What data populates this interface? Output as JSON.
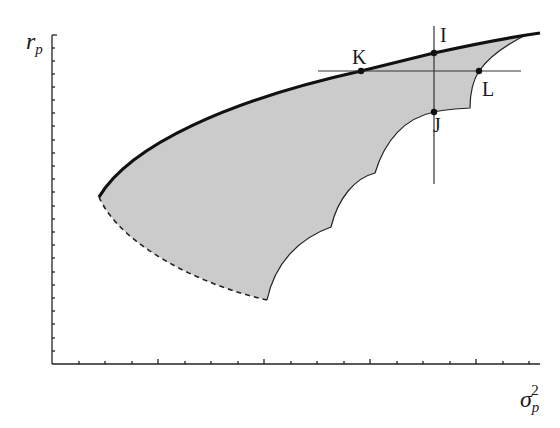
{
  "figure": {
    "type": "portfolio-feasible-region-diagram",
    "y_axis": {
      "label": "r",
      "label_sub": "p"
    },
    "x_axis": {
      "label": "σ",
      "label_sub": "p",
      "label_sup": "2"
    },
    "points": [
      {
        "id": "I",
        "label": "I"
      },
      {
        "id": "J",
        "label": "J"
      },
      {
        "id": "K",
        "label": "K"
      },
      {
        "id": "L",
        "label": "L"
      }
    ],
    "colors": {
      "fill": "#cccccc",
      "frontier": "#111111",
      "lines": "#333333",
      "axis": "#222222"
    }
  }
}
